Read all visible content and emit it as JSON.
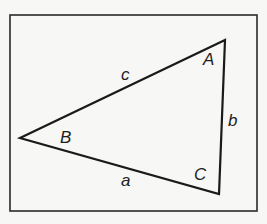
{
  "diagram": {
    "type": "triangle",
    "frame": {
      "x": 10,
      "y": 15,
      "width": 247,
      "height": 196,
      "stroke": "#2a2a2a"
    },
    "vertices": {
      "A": {
        "x": 225,
        "y": 40
      },
      "B": {
        "x": 20,
        "y": 138
      },
      "C": {
        "x": 219,
        "y": 194
      }
    },
    "angle_labels": [
      {
        "id": "A",
        "text": "A",
        "x": 203,
        "y": 65
      },
      {
        "id": "B",
        "text": "B",
        "x": 60,
        "y": 143
      },
      {
        "id": "C",
        "text": "C",
        "x": 194,
        "y": 180
      }
    ],
    "side_labels": [
      {
        "id": "a",
        "text": "a",
        "opposite": "A",
        "x": 121,
        "y": 186
      },
      {
        "id": "b",
        "text": "b",
        "opposite": "B",
        "x": 228,
        "y": 126
      },
      {
        "id": "c",
        "text": "c",
        "opposite": "C",
        "x": 121,
        "y": 80
      }
    ],
    "stroke_color": "#1a1a1a",
    "background": "#f7f7f5"
  }
}
